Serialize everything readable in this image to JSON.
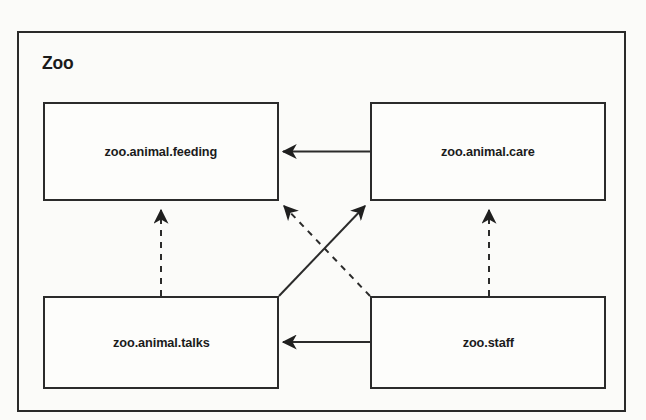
{
  "diagram": {
    "kind": "uml-package-diagram",
    "package": {
      "name": "Zoo"
    },
    "nodes": [
      {
        "id": "feeding",
        "label": "zoo.animal.feeding",
        "x": 43,
        "y": 102,
        "width": 236,
        "height": 99
      },
      {
        "id": "care",
        "label": "zoo.animal.care",
        "x": 370,
        "y": 102,
        "width": 236,
        "height": 99
      },
      {
        "id": "talks",
        "label": "zoo.animal.talks",
        "x": 43,
        "y": 296,
        "width": 236,
        "height": 93
      },
      {
        "id": "staff",
        "label": "zoo.staff",
        "x": 370,
        "y": 296,
        "width": 236,
        "height": 93
      }
    ],
    "edges": [
      {
        "id": "care-to-feeding",
        "from": "care",
        "to": "feeding",
        "style": "solid",
        "arrow": "filled",
        "orientation": "horizontal"
      },
      {
        "id": "staff-to-talks",
        "from": "staff",
        "to": "talks",
        "style": "solid",
        "arrow": "filled",
        "orientation": "horizontal"
      },
      {
        "id": "talks-to-feeding",
        "from": "talks",
        "to": "feeding",
        "style": "dashed",
        "arrow": "filled",
        "orientation": "vertical"
      },
      {
        "id": "staff-to-care",
        "from": "staff",
        "to": "care",
        "style": "dashed",
        "arrow": "filled",
        "orientation": "vertical"
      },
      {
        "id": "talks-to-care",
        "from": "talks",
        "to": "care",
        "style": "solid",
        "arrow": "filled",
        "orientation": "diagonal"
      },
      {
        "id": "staff-to-feeding",
        "from": "staff",
        "to": "feeding",
        "style": "dashed",
        "arrow": "filled",
        "orientation": "diagonal"
      }
    ],
    "colors": {
      "background": "#fbfbf9",
      "line": "#2b2b2b",
      "text": "#1b1b1b",
      "node_fill": "#fdfdfb"
    }
  }
}
